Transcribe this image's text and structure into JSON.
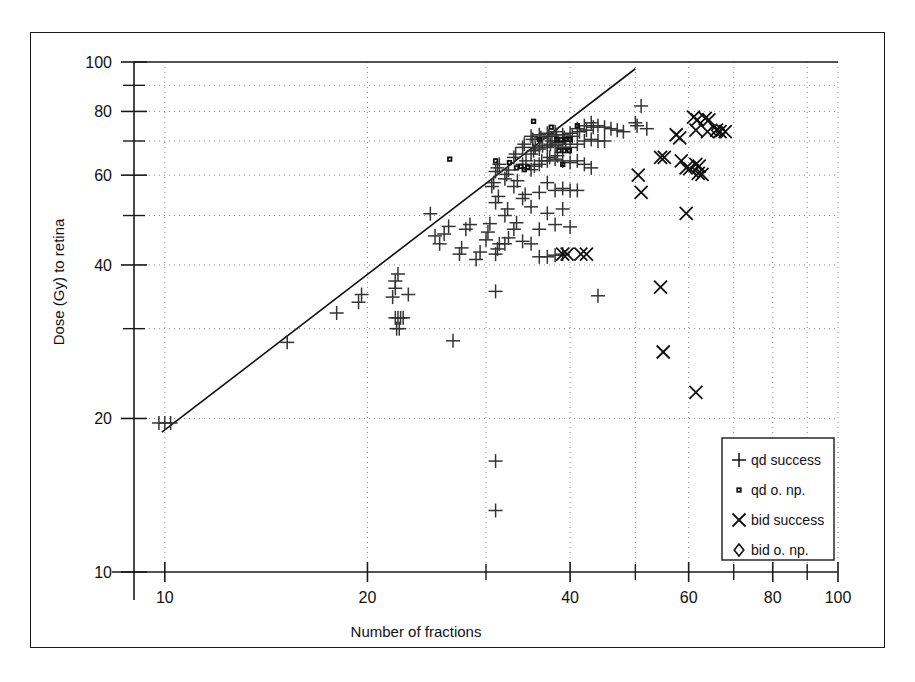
{
  "figure": {
    "background": "#ffffff",
    "border_color": "#1a1a1a"
  },
  "chart_data": {
    "type": "scatter",
    "title": "",
    "xlabel": "Number of fractions",
    "ylabel": "Dose (Gy) to retina",
    "xscale": "log",
    "yscale": "log",
    "xlim": [
      9,
      100
    ],
    "ylim": [
      10,
      100
    ],
    "grid": true,
    "grid_style": "dotted",
    "legend_position": "bottom-right",
    "xticks_major": [
      10,
      20,
      40,
      60,
      80,
      100
    ],
    "xticks_labels": [
      "10",
      "20",
      "40",
      "60",
      "80",
      "100"
    ],
    "xticks_minor": [
      30,
      50,
      70,
      90
    ],
    "yticks_major": [
      10,
      20,
      40,
      60,
      80,
      100
    ],
    "yticks_labels": [
      "10",
      "20",
      "40",
      "60",
      "80",
      "100"
    ],
    "yticks_minor": [
      30,
      50,
      70,
      90
    ],
    "trendline": {
      "label": "",
      "color": "#111111",
      "x": [
        9.9,
        50.0
      ],
      "y": [
        18.8,
        97.0
      ]
    },
    "series": [
      {
        "name": "qd success",
        "marker": "plus",
        "color": "#333333",
        "points": [
          [
            9.8,
            19.6
          ],
          [
            10.0,
            19.6
          ],
          [
            10.2,
            19.6
          ],
          [
            15.2,
            28.2
          ],
          [
            18.0,
            32.2
          ],
          [
            19.4,
            33.8
          ],
          [
            19.6,
            35.0
          ],
          [
            21.8,
            34.6
          ],
          [
            22.0,
            36.0
          ],
          [
            22.0,
            37.2
          ],
          [
            22.2,
            38.4
          ],
          [
            22.0,
            31.5
          ],
          [
            22.2,
            31.5
          ],
          [
            22.4,
            31.5
          ],
          [
            22.6,
            31.5
          ],
          [
            22.1,
            30.0
          ],
          [
            22.3,
            30.0
          ],
          [
            23.0,
            35.0
          ],
          [
            24.8,
            50.4
          ],
          [
            25.2,
            45.6
          ],
          [
            25.6,
            44.0
          ],
          [
            26.0,
            46.0
          ],
          [
            26.4,
            47.6
          ],
          [
            26.8,
            28.4
          ],
          [
            27.4,
            42.0
          ],
          [
            27.6,
            43.2
          ],
          [
            28.0,
            47.0
          ],
          [
            28.4,
            48.0
          ],
          [
            29.0,
            41.0
          ],
          [
            29.4,
            42.4
          ],
          [
            30.0,
            44.8
          ],
          [
            30.2,
            46.4
          ],
          [
            30.4,
            48.2
          ],
          [
            30.6,
            57.0
          ],
          [
            30.8,
            58.0
          ],
          [
            31.0,
            61.0
          ],
          [
            31.2,
            62.0
          ],
          [
            31.4,
            63.0
          ],
          [
            31.0,
            53.0
          ],
          [
            31.3,
            54.5
          ],
          [
            31.0,
            42.0
          ],
          [
            31.2,
            43.0
          ],
          [
            31.4,
            44.0
          ],
          [
            31.0,
            35.5
          ],
          [
            31.0,
            16.5
          ],
          [
            31.0,
            13.2
          ],
          [
            32.0,
            59.0
          ],
          [
            32.2,
            60.2
          ],
          [
            32.4,
            61.4
          ],
          [
            32.0,
            50.0
          ],
          [
            32.3,
            51.5
          ],
          [
            32.0,
            44.0
          ],
          [
            32.4,
            45.2
          ],
          [
            33.0,
            65.0
          ],
          [
            33.2,
            66.0
          ],
          [
            33.0,
            57.0
          ],
          [
            33.4,
            58.5
          ],
          [
            33.0,
            47.0
          ],
          [
            33.3,
            48.4
          ],
          [
            34.0,
            68.0
          ],
          [
            34.2,
            69.0
          ],
          [
            34.0,
            63.0
          ],
          [
            34.4,
            64.0
          ],
          [
            34.0,
            54.0
          ],
          [
            34.3,
            55.0
          ],
          [
            34.0,
            44.5
          ],
          [
            35.0,
            71.5
          ],
          [
            35.2,
            70.5
          ],
          [
            35.0,
            66.0
          ],
          [
            35.3,
            67.0
          ],
          [
            35.5,
            68.0
          ],
          [
            35.0,
            61.5
          ],
          [
            35.4,
            62.5
          ],
          [
            35.0,
            52.0
          ],
          [
            35.0,
            44.0
          ],
          [
            36.0,
            72.0
          ],
          [
            36.2,
            71.0
          ],
          [
            36.0,
            67.5
          ],
          [
            36.4,
            68.5
          ],
          [
            36.0,
            63.0
          ],
          [
            36.3,
            64.0
          ],
          [
            36.0,
            55.5
          ],
          [
            36.0,
            47.0
          ],
          [
            36.0,
            41.5
          ],
          [
            37.0,
            72.5
          ],
          [
            37.2,
            71.5
          ],
          [
            37.0,
            68.0
          ],
          [
            37.4,
            69.0
          ],
          [
            37.6,
            70.0
          ],
          [
            37.0,
            64.0
          ],
          [
            37.3,
            65.0
          ],
          [
            37.0,
            58.0
          ],
          [
            37.0,
            50.5
          ],
          [
            37.0,
            41.5
          ],
          [
            38.0,
            73.0
          ],
          [
            38.2,
            72.0
          ],
          [
            38.0,
            68.5
          ],
          [
            38.4,
            69.5
          ],
          [
            38.0,
            64.5
          ],
          [
            38.3,
            65.5
          ],
          [
            38.0,
            56.0
          ],
          [
            38.0,
            48.0
          ],
          [
            38.0,
            41.8
          ],
          [
            39.0,
            72.0
          ],
          [
            39.2,
            71.0
          ],
          [
            39.0,
            68.0
          ],
          [
            39.4,
            69.0
          ],
          [
            39.0,
            64.0
          ],
          [
            39.0,
            56.5
          ],
          [
            39.0,
            51.5
          ],
          [
            39.0,
            42.0
          ],
          [
            40.0,
            72.5
          ],
          [
            40.3,
            71.5
          ],
          [
            40.0,
            68.0
          ],
          [
            40.0,
            63.5
          ],
          [
            40.0,
            56.0
          ],
          [
            40.0,
            47.5
          ],
          [
            41.0,
            74.0
          ],
          [
            41.3,
            73.0
          ],
          [
            41.0,
            69.0
          ],
          [
            41.0,
            64.0
          ],
          [
            41.0,
            56.0
          ],
          [
            42.0,
            75.0
          ],
          [
            42.3,
            73.5
          ],
          [
            42.0,
            70.0
          ],
          [
            42.0,
            63.0
          ],
          [
            43.0,
            76.0
          ],
          [
            43.3,
            74.5
          ],
          [
            43.0,
            70.5
          ],
          [
            43.0,
            62.0
          ],
          [
            44.0,
            75.0
          ],
          [
            44.0,
            70.0
          ],
          [
            44.0,
            34.8
          ],
          [
            45.0,
            74.5
          ],
          [
            45.0,
            70.0
          ],
          [
            46.0,
            74.0
          ],
          [
            47.0,
            73.5
          ],
          [
            48.0,
            73.0
          ],
          [
            50.0,
            76.0
          ],
          [
            50.3,
            75.0
          ],
          [
            51.0,
            82.0
          ],
          [
            52.0,
            74.0
          ]
        ]
      },
      {
        "name": "qd o. np.",
        "marker": "square",
        "color": "#111111",
        "points": [
          [
            26.5,
            64.5
          ],
          [
            31.0,
            64.0
          ],
          [
            32.5,
            63.5
          ],
          [
            33.3,
            62.0
          ],
          [
            33.8,
            62.4
          ],
          [
            34.2,
            61.5
          ],
          [
            34.6,
            62.2
          ],
          [
            35.3,
            76.5
          ],
          [
            37.5,
            74.5
          ],
          [
            38.2,
            70.5
          ],
          [
            38.8,
            70.5
          ],
          [
            39.4,
            70.5
          ],
          [
            40.0,
            70.5
          ],
          [
            38.5,
            67.0
          ],
          [
            39.2,
            67.0
          ],
          [
            39.9,
            67.0
          ],
          [
            39.0,
            63.0
          ],
          [
            41.0,
            75.0
          ],
          [
            36.0,
            70.5
          ]
        ]
      },
      {
        "name": "bid success",
        "marker": "cross",
        "color": "#111111",
        "points": [
          [
            39.0,
            42.0
          ],
          [
            39.6,
            42.0
          ],
          [
            41.5,
            42.0
          ],
          [
            42.3,
            42.0
          ],
          [
            50.5,
            60.0
          ],
          [
            51.0,
            55.5
          ],
          [
            54.5,
            65.0
          ],
          [
            55.2,
            65.0
          ],
          [
            54.5,
            36.2
          ],
          [
            55.0,
            27.0
          ],
          [
            57.5,
            72.0
          ],
          [
            58.2,
            71.0
          ],
          [
            58.5,
            64.0
          ],
          [
            59.5,
            62.0
          ],
          [
            60.2,
            61.8
          ],
          [
            59.5,
            50.5
          ],
          [
            61.0,
            78.0
          ],
          [
            61.8,
            77.0
          ],
          [
            61.5,
            73.5
          ],
          [
            61.5,
            63.0
          ],
          [
            62.2,
            62.5
          ],
          [
            62.0,
            60.5
          ],
          [
            62.8,
            60.2
          ],
          [
            61.5,
            22.5
          ],
          [
            63.5,
            77.5
          ],
          [
            64.3,
            77.0
          ],
          [
            64.0,
            73.0
          ],
          [
            66.0,
            73.5
          ],
          [
            66.8,
            73.0
          ],
          [
            68.0,
            73.0
          ]
        ]
      },
      {
        "name": "bid o. np.",
        "marker": "diamond",
        "color": "#111111",
        "points": [
          [
            66.0,
            73.5
          ],
          [
            67.0,
            73.0
          ],
          [
            62.0,
            61.0
          ]
        ]
      }
    ]
  },
  "legend": {
    "items": [
      {
        "label": "qd success",
        "marker": "plus"
      },
      {
        "label": "qd o. np.",
        "marker": "square"
      },
      {
        "label": "bid success",
        "marker": "cross"
      },
      {
        "label": "bid o. np.",
        "marker": "diamond"
      }
    ]
  }
}
